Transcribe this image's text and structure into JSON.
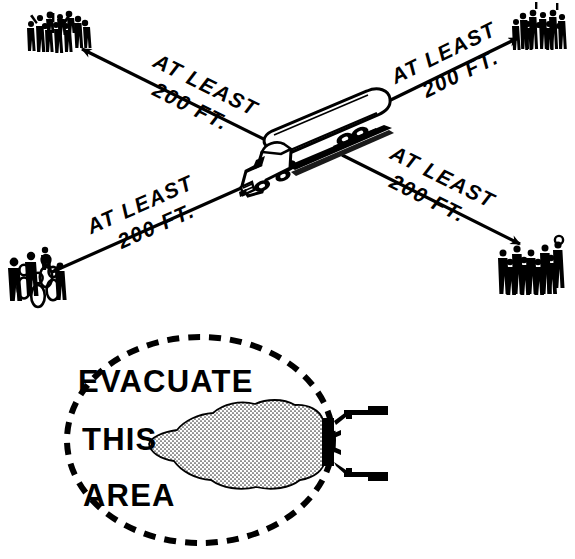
{
  "figure": {
    "background_color": "#ffffff",
    "ink_color": "#000000",
    "width": 575,
    "height": 559
  },
  "top_diagram": {
    "name": "evacuation-distance-diagram",
    "center_subject": "tank-truck",
    "arrows": [
      {
        "id": "arrow-upper-left",
        "direction": "upper-left",
        "label_line1": "AT LEAST",
        "label_line2": "200 FT.",
        "target": "crowd-upper-left"
      },
      {
        "id": "arrow-upper-right",
        "direction": "upper-right",
        "label_line1": "AT LEAST",
        "label_line2": "200 FT.",
        "target": "crowd-upper-right"
      },
      {
        "id": "arrow-lower-left",
        "direction": "lower-left",
        "label_line1": "AT LEAST",
        "label_line2": "200 FT.",
        "target": "crowd-lower-left"
      },
      {
        "id": "arrow-lower-right",
        "direction": "lower-right",
        "label_line1": "AT LEAST",
        "label_line2": "200 FT.",
        "target": "crowd-lower-right"
      }
    ],
    "crowds": [
      {
        "id": "crowd-upper-left",
        "label": "crowd of people"
      },
      {
        "id": "crowd-upper-right",
        "label": "crowd of people"
      },
      {
        "id": "crowd-lower-left",
        "label": "crowd of people"
      },
      {
        "id": "crowd-lower-right",
        "label": "crowd of people"
      }
    ]
  },
  "bottom_diagram": {
    "name": "evacuate-this-area-diagram",
    "boundary_style": "dashed-ellipse",
    "lines": [
      {
        "id": "line-1",
        "text": "EVACUATE"
      },
      {
        "id": "line-2",
        "text": "THIS"
      },
      {
        "id": "line-3",
        "text": "AREA"
      }
    ],
    "vapor_cloud_label": "vapor cloud",
    "tanker_rear_label": "tank truck rear"
  }
}
